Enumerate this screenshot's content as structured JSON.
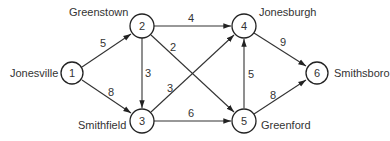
{
  "diagram": {
    "type": "directed-weighted-graph",
    "nodes": [
      {
        "id": "1",
        "label": "1",
        "city": "Jonesville"
      },
      {
        "id": "2",
        "label": "2",
        "city": "Greenstown"
      },
      {
        "id": "3",
        "label": "3",
        "city": "Smithfield"
      },
      {
        "id": "4",
        "label": "4",
        "city": "Jonesburgh"
      },
      {
        "id": "5",
        "label": "5",
        "city": "Greenford"
      },
      {
        "id": "6",
        "label": "6",
        "city": "Smithsboro"
      }
    ],
    "edges": [
      {
        "from": "1",
        "to": "2",
        "weight": "5"
      },
      {
        "from": "1",
        "to": "3",
        "weight": "8"
      },
      {
        "from": "2",
        "to": "4",
        "weight": "4"
      },
      {
        "from": "2",
        "to": "3",
        "weight": "3"
      },
      {
        "from": "2",
        "to": "5",
        "weight": "2"
      },
      {
        "from": "3",
        "to": "4",
        "weight": "3"
      },
      {
        "from": "3",
        "to": "5",
        "weight": "6"
      },
      {
        "from": "5",
        "to": "4",
        "weight": "5"
      },
      {
        "from": "4",
        "to": "6",
        "weight": "9"
      },
      {
        "from": "5",
        "to": "6",
        "weight": "8"
      }
    ]
  }
}
